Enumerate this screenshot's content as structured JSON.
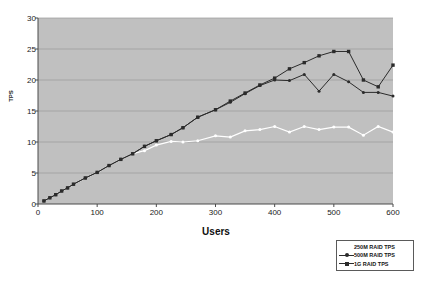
{
  "chart_data": {
    "type": "line",
    "title": "",
    "xlabel": "Users",
    "ylabel": "TPS",
    "xlim": [
      0,
      600
    ],
    "ylim": [
      0,
      30
    ],
    "xticks": [
      0,
      100,
      200,
      300,
      400,
      500,
      600
    ],
    "yticks": [
      0,
      5,
      10,
      15,
      20,
      25,
      30
    ],
    "grid": true,
    "grid_axis": "y",
    "legend_position": "bottom-right",
    "plot_background": "#c0c0c0",
    "series": [
      {
        "name": "250M RAID TPS",
        "color": "#ffffff",
        "marker": "none",
        "x": [
          10,
          20,
          30,
          40,
          50,
          60,
          80,
          100,
          120,
          140,
          160,
          180,
          200,
          225,
          245,
          270,
          300,
          325,
          350,
          375,
          400,
          425,
          450,
          475,
          500,
          525,
          550,
          575,
          600
        ],
        "values": [
          0.5,
          1.0,
          1.5,
          2.1,
          2.6,
          3.2,
          4.2,
          5.1,
          6.2,
          7.2,
          8.1,
          8.6,
          9.5,
          10.1,
          10.0,
          10.2,
          11.0,
          10.8,
          11.8,
          12.0,
          12.5,
          11.6,
          12.5,
          12.0,
          12.4,
          12.4,
          11.1,
          12.5,
          11.6
        ]
      },
      {
        "name": "500M RAID TPS",
        "color": "#2b2b2b",
        "marker": "dot",
        "x": [
          10,
          20,
          30,
          40,
          50,
          60,
          80,
          100,
          120,
          140,
          160,
          180,
          200,
          225,
          245,
          270,
          300,
          325,
          350,
          375,
          400,
          425,
          450,
          475,
          500,
          525,
          550,
          575,
          600
        ],
        "values": [
          0.5,
          1.0,
          1.5,
          2.1,
          2.6,
          3.2,
          4.2,
          5.1,
          6.2,
          7.2,
          8.1,
          9.3,
          10.2,
          11.2,
          12.3,
          14.0,
          15.2,
          16.4,
          17.8,
          19.1,
          20.0,
          19.9,
          20.9,
          18.2,
          20.9,
          19.7,
          18.0,
          18.0,
          17.4
        ]
      },
      {
        "name": "1G RAID TPS",
        "color": "#2b2b2b",
        "marker": "square",
        "x": [
          10,
          20,
          30,
          40,
          50,
          60,
          80,
          100,
          120,
          140,
          160,
          180,
          200,
          225,
          245,
          270,
          300,
          325,
          350,
          375,
          400,
          425,
          450,
          475,
          500,
          525,
          550,
          575,
          600
        ],
        "values": [
          0.5,
          1.0,
          1.5,
          2.1,
          2.6,
          3.2,
          4.2,
          5.1,
          6.2,
          7.2,
          8.1,
          9.3,
          10.2,
          11.2,
          12.3,
          14.0,
          15.2,
          16.6,
          17.9,
          19.2,
          20.3,
          21.8,
          22.8,
          23.9,
          24.6,
          24.6,
          20.0,
          18.9,
          22.4
        ]
      }
    ]
  },
  "legend": {
    "entries": [
      {
        "label": "250M RAID TPS"
      },
      {
        "label": "500M RAID TPS"
      },
      {
        "label": "1G RAID TPS"
      }
    ]
  }
}
